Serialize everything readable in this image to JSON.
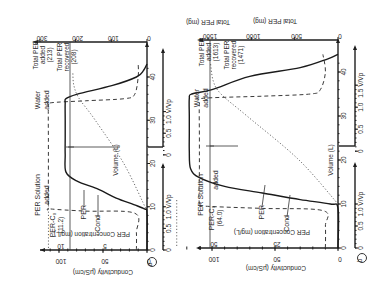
{
  "figure": {
    "orientation": "rotated 90 degrees (text reads bottom-to-top)",
    "panels": [
      "a",
      "b"
    ]
  },
  "chart_data": [
    {
      "panel": "a",
      "type": "line",
      "title": "",
      "xlabel": "Volume (L)",
      "x_secondary_label": "V/Vp",
      "ylabel": "Conductivity (μS/cm)",
      "y_secondary_label": "PER Concentration (mg/L)",
      "y_right_label": "Total PER (mg)",
      "x_ticks": [
        0,
        10,
        20,
        30,
        40
      ],
      "x_secondary_ticks_segment1": [
        "0",
        "0.5",
        "1.0 V/Vp"
      ],
      "x_secondary_ticks_segment2": [
        "0",
        "0.5",
        "1.0 V/Vp"
      ],
      "y_ticks": [
        0,
        50,
        100
      ],
      "y_secondary_ticks": [
        {
          "value": "5",
          "at_cond": 50
        },
        {
          "value": "10",
          "at_cond": 100
        }
      ],
      "y_right_ticks": [
        0,
        100,
        200,
        300
      ],
      "xlim": [
        0,
        45
      ],
      "ylim": [
        0,
        120
      ],
      "annotations": [
        {
          "text": "PER Solution added",
          "x_range": [
            0,
            22
          ]
        },
        {
          "text": "Water added",
          "x_range": [
            22,
            45
          ]
        },
        {
          "text": "PER-Co (11.2)",
          "target": "C0 line"
        },
        {
          "text": "Total PER added (213)"
        },
        {
          "text": "Total PER recovered (208)"
        },
        {
          "text": "PER",
          "target": "solid curve"
        },
        {
          "text": "Cond",
          "target": "dashed curve"
        }
      ],
      "series": [
        {
          "name": "PER",
          "style": "solid",
          "x": [
            0,
            8.5,
            9.5,
            10.5,
            12,
            14,
            16,
            18,
            22,
            26,
            30,
            34,
            35,
            36,
            38,
            40,
            41.5,
            43
          ],
          "y": [
            0,
            0,
            3,
            15,
            35,
            55,
            80,
            92,
            93,
            93,
            93,
            93,
            92,
            80,
            40,
            12,
            4,
            0
          ]
        },
        {
          "name": "Cond",
          "style": "dashed",
          "x": [
            0,
            4,
            8.5,
            9,
            9.5,
            10,
            18,
            25,
            33,
            34,
            34.5,
            35,
            36,
            40,
            43
          ],
          "y": [
            12,
            12,
            14,
            70,
            110,
            112,
            112,
            112,
            112,
            110,
            70,
            25,
            14,
            10,
            10
          ]
        },
        {
          "name": "Total PER (mg)",
          "style": "dotted",
          "axis": "right",
          "x": [
            9,
            20,
            30,
            35,
            38,
            41
          ],
          "y": [
            0,
            65,
            145,
            190,
            205,
            208
          ]
        }
      ],
      "references": {
        "C0_line_cond": 112,
        "water_switch_volume": 22
      }
    },
    {
      "panel": "b",
      "type": "line",
      "title": "",
      "xlabel": "Volume (L)",
      "x_secondary_label": "V/Vp",
      "ylabel": "Conductivity (μS/cm)",
      "y_secondary_label": "PER Concentration (mg/L)",
      "y_right_label": "Total PER (mg)",
      "x_ticks": [
        0,
        10,
        20,
        30,
        40
      ],
      "x_secondary_ticks_segment1": [
        "0",
        "0.5",
        "1.0 V/Vp"
      ],
      "x_secondary_ticks_segment2": [
        "0",
        "0.5",
        "1.0",
        "1.5 V/Vp"
      ],
      "y_ticks": [
        0,
        50,
        100
      ],
      "y_secondary_ticks": [
        {
          "value": "25",
          "at_cond": 50
        },
        {
          "value": "50",
          "at_cond": 100
        }
      ],
      "y_right_ticks": [
        0,
        500,
        1000,
        1500
      ],
      "xlim": [
        0,
        47
      ],
      "ylim": [
        0,
        135
      ],
      "annotations": [
        {
          "text": "PER Solution added",
          "x_range": [
            0,
            22
          ]
        },
        {
          "text": "Water added",
          "x_range": [
            22,
            47
          ]
        },
        {
          "text": "PER-Co (64.0)",
          "target": "C0 line"
        },
        {
          "text": "Total PER added (1613)"
        },
        {
          "text": "Total PER recovered (1471)"
        },
        {
          "text": "PER",
          "target": "solid curve"
        },
        {
          "text": "Cond",
          "target": "dashed curve"
        }
      ],
      "series": [
        {
          "name": "PER",
          "style": "solid",
          "x": [
            0,
            9,
            10,
            11,
            12.5,
            14,
            16,
            18,
            22,
            26,
            30,
            34,
            35,
            36,
            39,
            41,
            43,
            44
          ],
          "y": [
            0,
            0,
            6,
            30,
            60,
            90,
            110,
            117,
            118,
            118,
            118,
            118,
            116,
            100,
            70,
            30,
            8,
            0
          ]
        },
        {
          "name": "Cond",
          "style": "dashed",
          "x": [
            0,
            5,
            8.5,
            9,
            9.5,
            10,
            18,
            25,
            33,
            34,
            34.5,
            35,
            36,
            40,
            44
          ],
          "y": [
            10,
            10,
            12,
            60,
            105,
            110,
            110,
            110,
            110,
            108,
            60,
            22,
            14,
            10,
            12
          ]
        },
        {
          "name": "Total PER (mg)",
          "style": "dotted",
          "axis": "right",
          "x": [
            10,
            20,
            30,
            35,
            38,
            42
          ],
          "y": [
            0,
            450,
            1050,
            1350,
            1440,
            1471
          ]
        }
      ],
      "references": {
        "C0_line_cond": 128,
        "water_switch_volume": 22
      }
    }
  ],
  "labels": {
    "panel_a_marker": "a",
    "panel_b_marker": "b",
    "volume_axis": "Volume (L)",
    "cond_axis": "Conductivity (μS/cm)",
    "per_conc_axis": "PER Concentration (mg/L)",
    "total_per_axis": "Total PER (mg)",
    "per_solution_added": "PER Solution added",
    "per_solution_line1": "PER Solution",
    "per_solution_line2": "added",
    "water_added_line1": "Water",
    "water_added_line2": "added",
    "per_curve": "PER",
    "cond_curve": "Cond",
    "vvp": "V/Vp",
    "a": {
      "c0_line1": "PER-C₀",
      "c0_line2": "(11.2)",
      "added_line1": "Total PER",
      "added_line2": "added",
      "added_line3": "(213)",
      "recovered_line1": "Total PER",
      "recovered_line2": "recovered",
      "recovered_line3": "(208)",
      "vol_ticks": [
        "0",
        "10",
        "20",
        "30",
        "40"
      ],
      "vvp_ticks1": [
        "0",
        "0.5",
        "1.0"
      ],
      "vvp_ticks2": [
        "0",
        "0.5",
        "1.0"
      ],
      "cond_ticks": [
        "0",
        "50",
        "100"
      ],
      "conc_ticks": [
        "5",
        "10"
      ],
      "tot_ticks": [
        "0",
        "100",
        "200",
        "300"
      ]
    },
    "b": {
      "c0_line1": "PER-C₀",
      "c0_line2": "(64.0)",
      "added_line1": "Total PER",
      "added_line2": "added",
      "added_line3": "(1613)",
      "recovered_line1": "Total PER",
      "recovered_line2": "recovered",
      "recovered_line3": "(1471)",
      "vol_ticks": [
        "0",
        "10",
        "20",
        "30",
        "40"
      ],
      "vvp_ticks1": [
        "0",
        "0.5",
        "1.0"
      ],
      "vvp_ticks2": [
        "0",
        "0.5",
        "1.0",
        "1.5"
      ],
      "cond_ticks": [
        "0",
        "50",
        "100"
      ],
      "conc_ticks": [
        "25",
        "50"
      ],
      "tot_ticks": [
        "0",
        "500",
        "1000",
        "1500"
      ]
    }
  },
  "colors": {
    "ink": "#1e1e1e",
    "dotted": "#6a6a6a",
    "background": "#ffffff"
  }
}
